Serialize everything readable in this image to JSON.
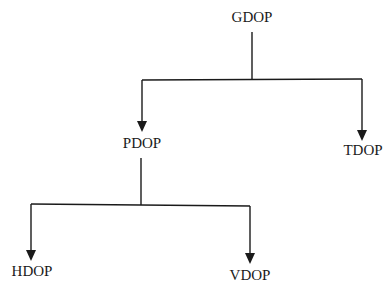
{
  "diagram": {
    "type": "tree",
    "colors": {
      "line": "#1a1a1a",
      "text": "#1a1a1a",
      "background": "#ffffff"
    },
    "nodes": [
      {
        "id": "gdop",
        "label": "GDOP"
      },
      {
        "id": "pdop",
        "label": "PDOP"
      },
      {
        "id": "tdop",
        "label": "TDOP"
      },
      {
        "id": "hdop",
        "label": "HDOP"
      },
      {
        "id": "vdop",
        "label": "VDOP"
      }
    ],
    "edges": [
      {
        "from": "GDOP",
        "to": "PDOP"
      },
      {
        "from": "GDOP",
        "to": "TDOP"
      },
      {
        "from": "PDOP",
        "to": "HDOP"
      },
      {
        "from": "PDOP",
        "to": "VDOP"
      }
    ]
  }
}
